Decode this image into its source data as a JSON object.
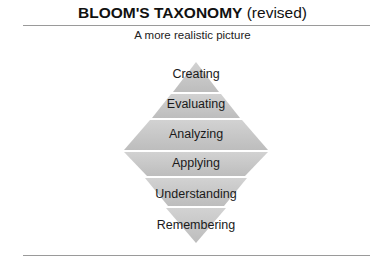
{
  "header": {
    "title_bold": "BLOOM'S TAXONOMY",
    "title_suffix": " (revised)",
    "subtitle": "A more realistic picture"
  },
  "diagram": {
    "fill_color": "#c8c8c8",
    "stroke_color": "#e8e8e8",
    "levels": [
      {
        "label": "Creating"
      },
      {
        "label": "Evaluating"
      },
      {
        "label": "Analyzing"
      },
      {
        "label": "Applying"
      },
      {
        "label": "Understanding"
      },
      {
        "label": "Remembering"
      }
    ]
  }
}
